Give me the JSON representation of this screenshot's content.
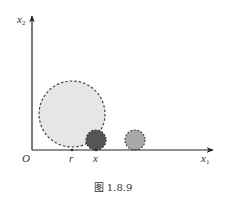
{
  "figure": {
    "caption": "图 1.8.9",
    "axes": {
      "y_label_main": "x",
      "y_label_sub": "2",
      "x_label_main": "x",
      "x_label_sub": "1",
      "origin_label": "O"
    },
    "ticks": [
      {
        "label": "r"
      },
      {
        "label": "x"
      }
    ],
    "circles": [
      {
        "name": "large-circle",
        "fill": "#e6e6e6",
        "stroke": "#444444"
      },
      {
        "name": "dark-circle",
        "fill": "#555555",
        "stroke": "#333333"
      },
      {
        "name": "medium-circle",
        "fill": "#a8a8a8",
        "stroke": "#444444"
      }
    ]
  }
}
